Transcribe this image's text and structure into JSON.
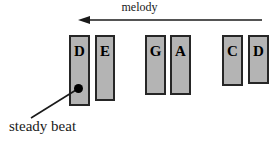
{
  "figure": {
    "width": 279,
    "height": 145,
    "background_color": "#ffffff"
  },
  "melody": {
    "label": "melody",
    "arrow_direction": "left",
    "arrow": {
      "x_start": 262,
      "x_end": 78,
      "y": 20,
      "color": "#1a1a1a"
    }
  },
  "annotation": {
    "label": "steady beat",
    "dot": {
      "x": 78,
      "y": 88,
      "color": "#000000"
    },
    "leader_line": {
      "x1": 31,
      "y1": 118,
      "x2": 76,
      "y2": 90,
      "color": "#1a1a1a"
    }
  },
  "style": {
    "bar_fill": "#b4b4b4",
    "bar_stroke": "#262626",
    "text_color": "#1a1a1a"
  },
  "bars": [
    {
      "label": "D",
      "x": 69,
      "y": 35,
      "width": 21,
      "height": 71
    },
    {
      "label": "E",
      "x": 95,
      "y": 35,
      "width": 20,
      "height": 66
    },
    {
      "label": "G",
      "x": 145,
      "y": 35,
      "width": 21,
      "height": 60
    },
    {
      "label": "A",
      "x": 170,
      "y": 35,
      "width": 21,
      "height": 60
    },
    {
      "label": "C",
      "x": 222,
      "y": 35,
      "width": 21,
      "height": 51
    },
    {
      "label": "D",
      "x": 248,
      "y": 35,
      "width": 21,
      "height": 49
    }
  ]
}
